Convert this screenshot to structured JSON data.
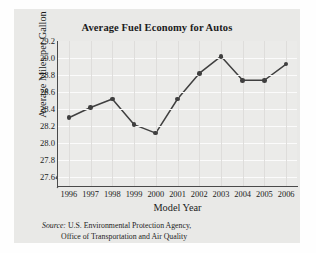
{
  "chart_data": {
    "type": "line",
    "title": "Average Fuel Economy for Autos",
    "xlabel": "Model Year",
    "ylabel": "Average Miles per Gallon",
    "categories": [
      "1996",
      "1997",
      "1998",
      "1999",
      "2000",
      "2001",
      "2002",
      "2003",
      "2004",
      "2005",
      "2006"
    ],
    "values": [
      28.3,
      28.42,
      28.52,
      28.22,
      28.12,
      28.52,
      28.82,
      29.02,
      28.74,
      28.74,
      28.93
    ],
    "yticks": [
      "29.2",
      "29.0",
      "28.8",
      "28.6",
      "28.4",
      "28.2",
      "28.0",
      "27.8",
      "27.6"
    ],
    "ylim": [
      27.5,
      29.2
    ],
    "xlim": [
      1995.5,
      2006.5
    ],
    "grid": true,
    "legend": false,
    "axis_break": true,
    "marker": "filled-circle",
    "series_color": "#3f3f3f"
  },
  "source": {
    "word": "Source:",
    "line1": "U.S. Environmental Protection Agency,",
    "line2": "Office of Transportation and Air Quality"
  },
  "colors": {
    "page_background": "#fefefe",
    "panel_background": "#e9e9e7",
    "plot_background": "#ebebe9",
    "axis": "#4a4a4a",
    "gridline_horizontal": "#fbfbfb",
    "gridline_vertical": "#dedddb",
    "text": "#1b1b1b"
  }
}
